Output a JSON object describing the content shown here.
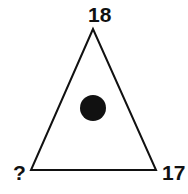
{
  "diagram": {
    "shape": "triangle",
    "center_marker": "filled-circle",
    "labels": {
      "top": "18",
      "bottom_left": "?",
      "bottom_right": "17"
    },
    "colors": {
      "stroke": "#111111",
      "fill": "#ffffff",
      "dot": "#111111"
    }
  }
}
